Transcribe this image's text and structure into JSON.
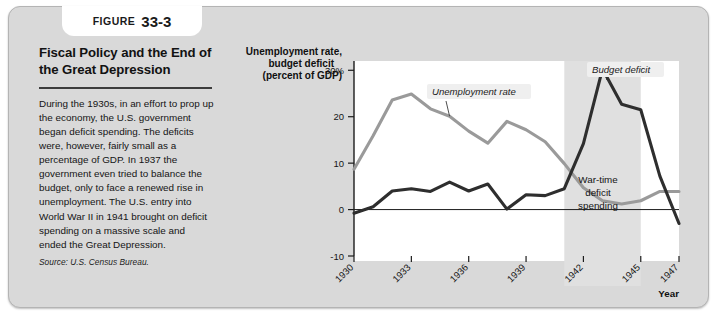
{
  "figure": {
    "badge_word": "FIGURE",
    "badge_number": "33-3",
    "title": "Fiscal Policy and the End of the Great Depression",
    "body": "During the 1930s, in an effort to prop up the economy, the U.S. government began deficit spending. The deficits were, however, fairly small as a percentage of GDP. In 1937 the government even tried to balance the budget, only to face a renewed rise in unemployment. The U.S. entry into World War II in 1941 brought on deficit spending on a massive scale and ended the Great Depression.",
    "source": "Source: U.S. Census Bureau."
  },
  "chart_data": {
    "type": "line",
    "title": "",
    "ylabel": "Unemployment rate, budget deficit (percent of GDP)",
    "ylabel_line1": "Unemployment rate,",
    "ylabel_line2": "budget deficit",
    "ylabel_line3": "(percent of GDP)",
    "xlabel": "Year",
    "ylim": [
      -10,
      32
    ],
    "xlim": [
      1930,
      1947
    ],
    "ytick_labels": [
      "30%",
      "20",
      "10",
      "0",
      "-10"
    ],
    "ytick_values": [
      30,
      20,
      10,
      0,
      -10
    ],
    "xtick_labels": [
      "1930",
      "1933",
      "1936",
      "1939",
      "1942",
      "1945",
      "1947"
    ],
    "xtick_values": [
      1930,
      1933,
      1936,
      1939,
      1942,
      1945,
      1947
    ],
    "grid": false,
    "legend_position": "inline-annotations",
    "x": [
      1930,
      1931,
      1932,
      1933,
      1934,
      1935,
      1936,
      1937,
      1938,
      1939,
      1940,
      1941,
      1942,
      1943,
      1944,
      1945,
      1946,
      1947
    ],
    "series": [
      {
        "name": "Unemployment rate",
        "color": "#9a9a9a",
        "values": [
          8.7,
          15.9,
          23.6,
          24.9,
          21.7,
          20.1,
          16.9,
          14.3,
          19.0,
          17.2,
          14.6,
          9.9,
          4.7,
          1.9,
          1.2,
          1.9,
          3.9,
          3.9
        ]
      },
      {
        "name": "Budget deficit",
        "color": "#2e2e2e",
        "values": [
          -0.8,
          0.6,
          4.0,
          4.5,
          3.9,
          5.9,
          4.0,
          5.5,
          0.1,
          3.2,
          3.0,
          4.5,
          14.2,
          30.3,
          22.7,
          21.5,
          7.2,
          -3.0
        ]
      }
    ],
    "shaded_region": {
      "label": "War-time deficit spending",
      "label_line1": "War-time",
      "label_line2": "deficit",
      "label_line3": "spending",
      "start": 1941,
      "end": 1945,
      "color": "#e0e0e0"
    },
    "annotations": [
      {
        "text": "Unemployment rate",
        "target_year": 1935
      },
      {
        "text": "Budget deficit",
        "target_year": 1943
      }
    ]
  }
}
